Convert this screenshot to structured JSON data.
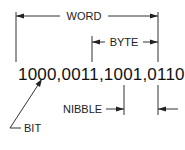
{
  "diagram": {
    "binary_value": "1000,0011,1001,0110",
    "labels": {
      "word": "WORD",
      "byte": "BYTE",
      "nibble": "NIBBLE",
      "bit": "BIT"
    },
    "colors": {
      "ink": "#222222",
      "background": "#ffffff"
    }
  }
}
